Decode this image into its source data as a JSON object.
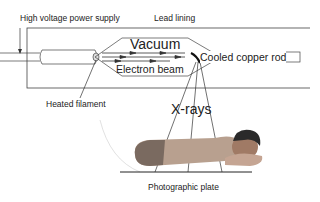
{
  "labels": {
    "power_supply": "High voltage power supply",
    "lead_lining": "Lead lining",
    "vacuum": "Vacuum",
    "electron_beam": "Electron beam",
    "copper_rod": "Cooled copper rod",
    "filament": "Heated filament",
    "xrays": "X-rays",
    "plate": "Photographic plate"
  },
  "colors": {
    "line": "#333333",
    "text": "#222222",
    "skin": "#b08a70",
    "hair": "#2a2a2a"
  }
}
